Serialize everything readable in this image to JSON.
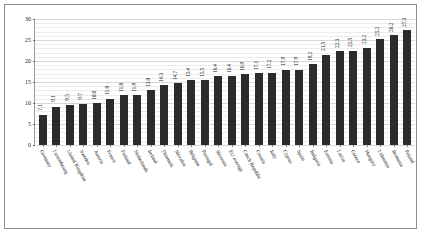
{
  "chart_data": {
    "type": "bar",
    "title": "",
    "subtitle": "",
    "xlabel": "",
    "ylabel": "",
    "ylim": [
      0,
      30
    ],
    "yticks": [
      0,
      5,
      10,
      15,
      20,
      25,
      30
    ],
    "ytick_labels": [
      "0",
      "5",
      "10",
      "15",
      "20",
      "25",
      "30"
    ],
    "grid": true,
    "grid_minor_step": 1,
    "grid_major_step": 5,
    "legend": null,
    "bar_color": "#2b2b2b",
    "value_labels_shown": true,
    "categories": [
      "Germany",
      "Luxembourg",
      "United Kingdom",
      "Sweden",
      "Austria",
      "France",
      "Finland",
      "Netherlands",
      "Ireland",
      "Denmark",
      "Slovakia",
      "Belgium",
      "Portugal",
      "Slovenia",
      "EU average",
      "Czech Republic",
      "Croatia",
      "Italy",
      "Cyprus",
      "Spain",
      "Bulgaria",
      "Estonia",
      "Latvia",
      "Greece",
      "Hungary",
      "Lithuania",
      "Romania",
      "Poland"
    ],
    "values": [
      7.1,
      9.1,
      9.5,
      9.7,
      10.0,
      11.0,
      11.8,
      11.9,
      13.0,
      14.3,
      14.7,
      15.4,
      15.5,
      16.4,
      16.4,
      16.9,
      17.1,
      17.2,
      17.9,
      17.9,
      19.2,
      21.5,
      22.3,
      22.5,
      23.2,
      25.2,
      26.2,
      27.3
    ],
    "value_label_strings": [
      "7.1",
      "9.1",
      "9.5",
      "9.7",
      "10.0",
      "11.0",
      "11.8",
      "11.9",
      "13.0",
      "14.3",
      "14.7",
      "15.4",
      "15.5",
      "16.4",
      "16.4",
      "16.9",
      "17.1",
      "17.2",
      "17.9",
      "17.9",
      "19.2",
      "21.5",
      "22.3",
      "22.5",
      "23.2",
      "25.2",
      "26.2",
      "27.3"
    ]
  }
}
